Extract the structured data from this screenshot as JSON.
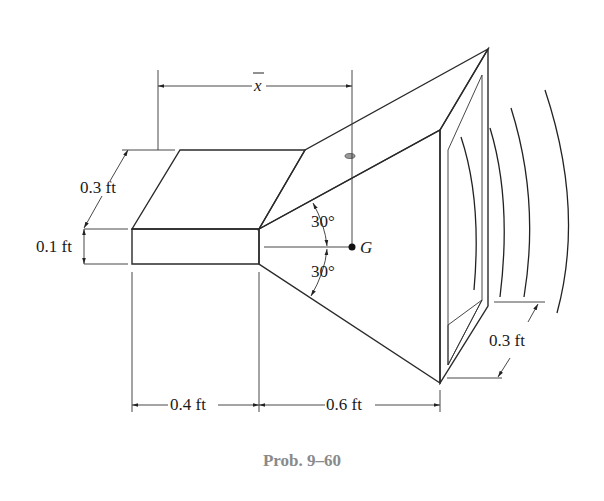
{
  "figure": {
    "caption": "Prob. 9–60",
    "colors": {
      "top_face": "#c9c9c9",
      "front_face": "#b8b8b8",
      "horn_top": "#cdcdcd",
      "horn_side": "#bdbdbd",
      "mouth_rim": "#b0b0b0",
      "mouth_inner": "#8e8e8e",
      "mouth_floor": "#7a7a7a",
      "caption": "#8a8a8a"
    },
    "dimensions": {
      "xbar": "x",
      "throat_depth": "0.3 ft",
      "throat_height": "0.1 ft",
      "throat_length": "0.4 ft",
      "horn_length": "0.6 ft",
      "mouth_depth": "0.3 ft",
      "angle_upper": "30°",
      "angle_lower": "30°",
      "centroid_label": "G"
    }
  }
}
